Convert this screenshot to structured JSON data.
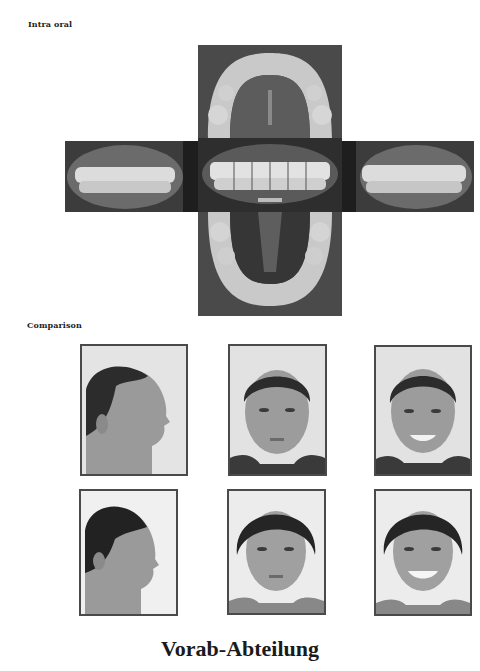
{
  "sections": {
    "intra_oral": {
      "label": "Intra oral",
      "photos": [
        {
          "view": "upper occlusal",
          "icon": "upper-arch-photo"
        },
        {
          "view": "right buccal",
          "icon": "right-buccal-photo"
        },
        {
          "view": "frontal",
          "icon": "frontal-teeth-photo"
        },
        {
          "view": "left buccal",
          "icon": "left-buccal-photo"
        },
        {
          "view": "lower occlusal",
          "icon": "lower-arch-photo"
        }
      ]
    },
    "comparison": {
      "label": "Comparison",
      "rows": [
        {
          "photos": [
            {
              "view": "profile"
            },
            {
              "view": "frontal"
            },
            {
              "view": "frontal smiling"
            }
          ]
        },
        {
          "photos": [
            {
              "view": "profile"
            },
            {
              "view": "frontal"
            },
            {
              "view": "frontal smiling"
            }
          ]
        }
      ]
    }
  },
  "caption": "Vorab-Abteilung",
  "colors": {
    "frame": "#4a4a4a",
    "text": "#1a1a1a",
    "photo_dark": "#3a3a3a"
  }
}
